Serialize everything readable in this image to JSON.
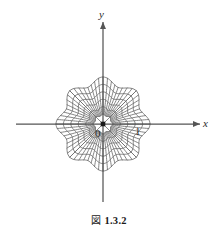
{
  "figure": {
    "caption_mark": "図",
    "caption_number": "1.3.2",
    "axis_x_label": "x",
    "axis_y_label": "y",
    "origin_label": "0",
    "unit_label": "1",
    "colors": {
      "grid": "#6e6e6e",
      "axis": "#555555",
      "diagonal": "#6e6e6e",
      "text": "#1a1a1a",
      "background": "#ffffff"
    }
  },
  "chart_data": {
    "type": "line",
    "xlabel": "x",
    "ylabel": "y",
    "grid": true,
    "legend": null,
    "origin_px": [
      103,
      124
    ],
    "axis_ranges": {
      "x": [
        -1.35,
        1.35
      ],
      "y": [
        -1.35,
        1.35
      ]
    },
    "unit_length_px": 38,
    "marked_points": [
      {
        "label": "0",
        "x": 0,
        "y": 0
      },
      {
        "label": "1",
        "x": 1,
        "y": 0
      }
    ],
    "radial_levels": [
      0.42,
      0.6,
      0.78,
      0.96,
      1.14
    ],
    "angular_levels_deg": [
      0,
      11.25,
      22.5,
      33.75,
      45,
      56.25,
      67.5,
      78.75,
      90
    ],
    "sector_count": 8,
    "boundary_shape": "rounded-octagon",
    "boundary_radius_axis_px": 77,
    "boundary_radius_diagonal_px": 82
  }
}
